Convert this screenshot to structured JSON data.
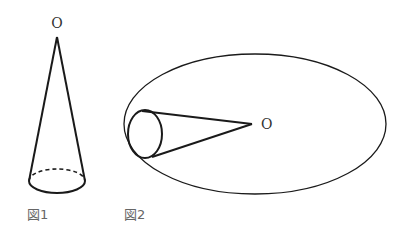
{
  "figure1": {
    "apex_label": "O",
    "caption": "図1"
  },
  "figure2": {
    "apex_label": "O",
    "caption": "図2"
  },
  "colors": {
    "stroke": "#1a1a1a",
    "caption": "#666666",
    "background": "#ffffff"
  }
}
